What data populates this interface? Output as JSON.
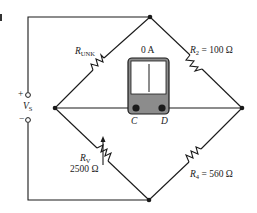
{
  "diagram": {
    "type": "wheatstone-bridge",
    "colors": {
      "wire": "#1a1a1a",
      "meter_body": "#8c8c8c",
      "meter_face": "#ffffff"
    },
    "source": {
      "symbol": "V",
      "subscript": "S",
      "plus": "+",
      "minus": "−"
    },
    "meter": {
      "reading": "0 A",
      "terminal_left": "C",
      "terminal_right": "D"
    },
    "resistors": {
      "r_unk": {
        "symbol": "R",
        "subscript": "UNK",
        "value": ""
      },
      "r2": {
        "symbol": "R",
        "subscript": "2",
        "equals": "=",
        "value": "100 Ω"
      },
      "rv": {
        "symbol": "R",
        "subscript": "V",
        "value": "2500 Ω",
        "variable": true
      },
      "r4": {
        "symbol": "R",
        "subscript": "4",
        "equals": "=",
        "value": "560 Ω"
      }
    }
  }
}
